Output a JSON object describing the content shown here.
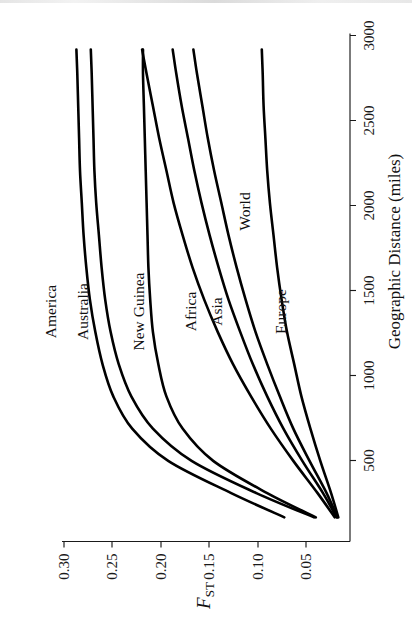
{
  "figure": {
    "orientation": "rotated-90-ccw",
    "background_color": "#ffffff",
    "line_color": "#000000"
  },
  "chart_data": {
    "type": "line",
    "title": "",
    "subtitle": "",
    "xlabel": "Geographic Distance (miles)",
    "ylabel": "F_ST",
    "ylabel_base": "F",
    "ylabel_sub": "ST",
    "xlim": [
      0,
      3150
    ],
    "ylim": [
      0.02,
      0.34
    ],
    "xticks": [
      500,
      1000,
      1500,
      2000,
      2500,
      3000
    ],
    "xticklabels": [
      "500",
      "1000",
      "1500",
      "2000",
      "2500",
      "3000"
    ],
    "yticks": [
      0.05,
      0.1,
      0.15,
      0.2,
      0.25,
      0.3
    ],
    "yticklabels": [
      "0.05",
      "0.10",
      "0.15",
      "0.20",
      "0.25",
      "0.30"
    ],
    "grid": false,
    "legend": "inline-curve-labels",
    "x": [
      150,
      300,
      500,
      700,
      900,
      1100,
      1300,
      1500,
      1700,
      1900,
      2100,
      2300,
      2500,
      2700,
      2900,
      3050
    ],
    "series": [
      {
        "name": "America",
        "label": "America",
        "values": [
          0.093,
          0.152,
          0.222,
          0.262,
          0.283,
          0.295,
          0.303,
          0.309,
          0.313,
          0.316,
          0.318,
          0.32,
          0.321,
          0.322,
          0.323,
          0.324
        ]
      },
      {
        "name": "Australia",
        "label": "Australia",
        "values": [
          0.06,
          0.124,
          0.196,
          0.239,
          0.263,
          0.277,
          0.286,
          0.292,
          0.296,
          0.299,
          0.302,
          0.304,
          0.305,
          0.306,
          0.307,
          0.308
        ]
      },
      {
        "name": "New Guinea",
        "label": "New Guinea",
        "values": [
          0.058,
          0.112,
          0.172,
          0.206,
          0.224,
          0.233,
          0.239,
          0.242,
          0.244,
          0.245,
          0.246,
          0.247,
          0.248,
          0.249,
          0.25,
          0.25
        ]
      },
      {
        "name": "Africa",
        "label": "Africa",
        "values": [
          0.037,
          0.056,
          0.083,
          0.108,
          0.13,
          0.15,
          0.167,
          0.182,
          0.195,
          0.206,
          0.216,
          0.224,
          0.232,
          0.239,
          0.246,
          0.251
        ]
      },
      {
        "name": "Asia",
        "label": "Asia",
        "values": [
          0.035,
          0.05,
          0.073,
          0.094,
          0.112,
          0.128,
          0.142,
          0.155,
          0.166,
          0.176,
          0.185,
          0.193,
          0.2,
          0.207,
          0.213,
          0.217
        ]
      },
      {
        "name": "World",
        "label": "World",
        "values": [
          0.034,
          0.046,
          0.065,
          0.083,
          0.098,
          0.112,
          0.125,
          0.136,
          0.146,
          0.155,
          0.163,
          0.171,
          0.178,
          0.184,
          0.19,
          0.194
        ]
      },
      {
        "name": "Europe",
        "label": "Europe",
        "values": [
          0.033,
          0.041,
          0.053,
          0.064,
          0.074,
          0.082,
          0.09,
          0.096,
          0.101,
          0.105,
          0.109,
          0.112,
          0.114,
          0.116,
          0.117,
          0.118
        ]
      }
    ]
  }
}
